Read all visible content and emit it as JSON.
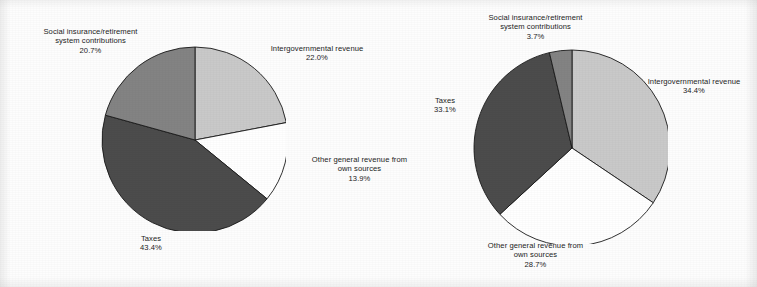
{
  "chart_data": [
    {
      "type": "pie",
      "title": "",
      "name": "federal-government-revenue-pie",
      "categories": [
        "Intergovernmental revenue",
        "Other general revenue from own sources",
        "Taxes",
        "Social insurance/retirement system contributions"
      ],
      "values": [
        22.0,
        13.9,
        43.4,
        20.7
      ],
      "value_labels": [
        "22.0%",
        "13.9%",
        "43.4%",
        "20.7%"
      ],
      "colors": [
        "#c9c9c9",
        "#ffffff",
        "#4c4c4c",
        "#838383"
      ],
      "start_angle_deg": 0,
      "direction": "clockwise",
      "legend": "none",
      "labels": [
        {
          "key": "social-insurance",
          "lines": [
            "Social insurance/retirement",
            "system contributions",
            "20.7%"
          ],
          "x": 24,
          "y": 27,
          "w": 133
        },
        {
          "key": "intergovernmental",
          "lines": [
            "Intergovernmental revenue",
            "22.0%"
          ],
          "x": 256,
          "y": 44,
          "w": 122
        },
        {
          "key": "other-general-revenue",
          "lines": [
            "Other general revenue from",
            "own sources",
            "13.9%"
          ],
          "x": 297,
          "y": 155,
          "w": 125
        },
        {
          "key": "taxes",
          "lines": [
            "Taxes",
            "43.4%"
          ],
          "x": 112,
          "y": 234,
          "w": 78
        }
      ],
      "geometry": {
        "cx": 193,
        "cy": 138,
        "r": 93
      }
    },
    {
      "type": "pie",
      "title": "",
      "name": "state-local-government-revenue-pie",
      "categories": [
        "Intergovernmental revenue",
        "Other general revenue from own sources",
        "Taxes",
        "Social insurance/retirement system contributions"
      ],
      "values": [
        34.4,
        28.7,
        33.1,
        3.7
      ],
      "value_labels": [
        "34.4%",
        "28.7%",
        "33.1%",
        "3.7%"
      ],
      "colors": [
        "#c9c9c9",
        "#ffffff",
        "#4c4c4c",
        "#838383"
      ],
      "start_angle_deg": 0,
      "direction": "clockwise",
      "legend": "none",
      "labels": [
        {
          "key": "social-insurance",
          "lines": [
            "Social insurance/retirement",
            "system contributions",
            "3.7%"
          ],
          "x": 469,
          "y": 13,
          "w": 133
        },
        {
          "key": "intergovernmental",
          "lines": [
            "Intergovernmental revenue",
            "34.4%"
          ],
          "x": 633,
          "y": 77,
          "w": 122
        },
        {
          "key": "taxes",
          "lines": [
            "Taxes",
            "33.1%"
          ],
          "x": 406,
          "y": 96,
          "w": 78
        },
        {
          "key": "other-general-revenue",
          "lines": [
            "Other general revenue from",
            "own sources",
            "28.7%"
          ],
          "x": 473,
          "y": 241,
          "w": 125
        }
      ],
      "geometry": {
        "cx": 570,
        "cy": 146,
        "r": 98
      }
    }
  ],
  "figure": {
    "background_color": "#ffffff",
    "slice_outline_color": "#1a1a1a",
    "text_color": "#1c1c1c"
  }
}
